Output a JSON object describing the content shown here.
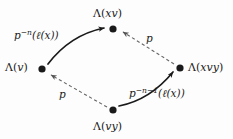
{
  "diagram": {
    "type": "commutative-diagram",
    "background_color": "#fdfdfd",
    "ink_color": "#1a1a1a",
    "nodes": [
      {
        "id": "top",
        "name": "lambda-xv",
        "label_plain": "Λ(xv)",
        "lambda": "Λ",
        "open_paren": "(",
        "arg": "xv",
        "close_paren": ")",
        "x": 113,
        "y": 29
      },
      {
        "id": "left",
        "name": "lambda-v",
        "label_plain": "Λ(v)",
        "lambda": "Λ",
        "open_paren": "(",
        "arg": "v",
        "close_paren": ")",
        "x": 42,
        "y": 69
      },
      {
        "id": "right",
        "name": "lambda-xvy",
        "label_plain": "Λ(xvy)",
        "lambda": "Λ",
        "open_paren": "(",
        "arg": "xvy",
        "close_paren": ")",
        "x": 180,
        "y": 68
      },
      {
        "id": "bottom",
        "name": "lambda-vy",
        "label_plain": "Λ(vy)",
        "lambda": "Λ",
        "open_paren": "(",
        "arg": "vy",
        "close_paren": ")",
        "x": 113,
        "y": 110
      }
    ],
    "edges": [
      {
        "id": "upper-left",
        "name": "edge-lambda-v-to-lambda-xv",
        "from": "left",
        "to": "top",
        "style": "solid",
        "curved": true,
        "label_plain": "p^{-n}(ℓ(x))",
        "label_base": "p",
        "label_exponent": "−n",
        "label_tail": "(ℓ(x))"
      },
      {
        "id": "upper-right",
        "name": "edge-lambda-xvy-to-lambda-xv",
        "from": "right",
        "to": "top",
        "style": "dashed",
        "curved": false,
        "label_plain": "p",
        "label_base": "p",
        "label_exponent": "",
        "label_tail": ""
      },
      {
        "id": "lower-left",
        "name": "edge-lambda-vy-to-lambda-v",
        "from": "bottom",
        "to": "left",
        "style": "dashed",
        "curved": false,
        "label_plain": "p",
        "label_base": "p",
        "label_exponent": "",
        "label_tail": ""
      },
      {
        "id": "lower-right",
        "name": "edge-lambda-vy-to-lambda-xvy",
        "from": "bottom",
        "to": "right",
        "style": "solid",
        "curved": true,
        "label_plain": "p^{-n-1}(ℓ(x))",
        "label_base": "p",
        "label_exponent": "−n−1",
        "label_tail": "(ℓ(x))"
      }
    ]
  }
}
